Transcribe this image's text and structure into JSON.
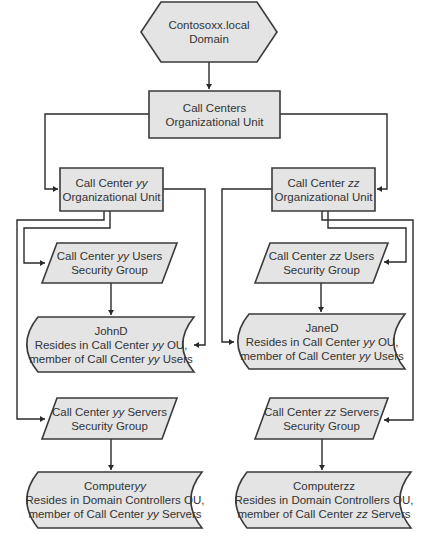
{
  "diagram": {
    "type": "flowchart",
    "nodes": {
      "domain": {
        "shape": "hexagon",
        "lines": [
          "Contosoxx.local",
          "Domain"
        ]
      },
      "call_centers_ou": {
        "shape": "rectangle",
        "lines": [
          "Call Centers",
          "Organizational Unit"
        ]
      },
      "cc_yy_ou": {
        "shape": "rectangle",
        "lines": [
          [
            {
              "t": "Call Center "
            },
            {
              "t": "yy",
              "i": true
            }
          ],
          [
            {
              "t": "Organizational Unit"
            }
          ]
        ]
      },
      "cc_zz_ou": {
        "shape": "rectangle",
        "lines": [
          [
            {
              "t": "Call Center "
            },
            {
              "t": "zz",
              "i": true
            }
          ],
          [
            {
              "t": "Organizational Unit"
            }
          ]
        ]
      },
      "cc_yy_users_group": {
        "shape": "parallelogram",
        "lines": [
          [
            {
              "t": "Call Center "
            },
            {
              "t": "yy",
              "i": true
            },
            {
              "t": " Users"
            }
          ],
          [
            {
              "t": "Security Group"
            }
          ]
        ]
      },
      "cc_zz_users_group": {
        "shape": "parallelogram",
        "lines": [
          [
            {
              "t": "Call Center "
            },
            {
              "t": "zz",
              "i": true
            },
            {
              "t": " Users"
            }
          ],
          [
            {
              "t": "Security Group"
            }
          ]
        ]
      },
      "johnd": {
        "shape": "stored-data",
        "lines": [
          [
            {
              "t": "JohnD"
            }
          ],
          [
            {
              "t": "Resides in Call Center "
            },
            {
              "t": "yy",
              "i": true
            },
            {
              "t": " OU,"
            }
          ],
          [
            {
              "t": "member of Call Center "
            },
            {
              "t": "yy",
              "i": true
            },
            {
              "t": " Users"
            }
          ]
        ]
      },
      "janed": {
        "shape": "stored-data",
        "lines": [
          [
            {
              "t": "JaneD"
            }
          ],
          [
            {
              "t": "Resides in Call Center "
            },
            {
              "t": "yy",
              "i": true
            },
            {
              "t": " OU,"
            }
          ],
          [
            {
              "t": "member of Call Center "
            },
            {
              "t": "yy",
              "i": true
            },
            {
              "t": " Users"
            }
          ]
        ]
      },
      "cc_yy_servers_group": {
        "shape": "parallelogram",
        "lines": [
          [
            {
              "t": "Call Center "
            },
            {
              "t": "yy",
              "i": true
            },
            {
              "t": " Servers"
            }
          ],
          [
            {
              "t": "Security Group"
            }
          ]
        ]
      },
      "cc_zz_servers_group": {
        "shape": "parallelogram",
        "lines": [
          [
            {
              "t": "Call Center "
            },
            {
              "t": "zz",
              "i": true
            },
            {
              "t": " Servers"
            }
          ],
          [
            {
              "t": "Security Group"
            }
          ]
        ]
      },
      "computeryy": {
        "shape": "stored-data",
        "lines": [
          [
            {
              "t": "Computer"
            },
            {
              "t": "yy",
              "i": true
            }
          ],
          [
            {
              "t": "Resides in Domain Controllers OU,"
            }
          ],
          [
            {
              "t": "member of Call Center "
            },
            {
              "t": "yy",
              "i": true
            },
            {
              "t": " Servers"
            }
          ]
        ]
      },
      "computerzz": {
        "shape": "stored-data",
        "lines": [
          [
            {
              "t": "Computerzz"
            }
          ],
          [
            {
              "t": "Resides in Domain Controllers OU,"
            }
          ],
          [
            {
              "t": "member of Call Center "
            },
            {
              "t": "zz",
              "i": true
            },
            {
              "t": " Servers"
            }
          ]
        ]
      }
    },
    "edges": [
      {
        "from": "domain",
        "to": "call_centers_ou"
      },
      {
        "from": "call_centers_ou",
        "to": "cc_yy_ou"
      },
      {
        "from": "call_centers_ou",
        "to": "cc_zz_ou"
      },
      {
        "from": "cc_yy_ou",
        "to": "cc_yy_users_group"
      },
      {
        "from": "cc_yy_ou",
        "to": "cc_yy_servers_group"
      },
      {
        "from": "cc_yy_ou",
        "to": "johnd"
      },
      {
        "from": "cc_yy_users_group",
        "to": "johnd"
      },
      {
        "from": "cc_yy_servers_group",
        "to": "computeryy"
      },
      {
        "from": "cc_zz_ou",
        "to": "cc_zz_users_group"
      },
      {
        "from": "cc_zz_ou",
        "to": "cc_zz_servers_group"
      },
      {
        "from": "cc_zz_ou",
        "to": "janed"
      },
      {
        "from": "cc_zz_users_group",
        "to": "janed"
      },
      {
        "from": "cc_zz_servers_group",
        "to": "computerzz"
      }
    ]
  }
}
